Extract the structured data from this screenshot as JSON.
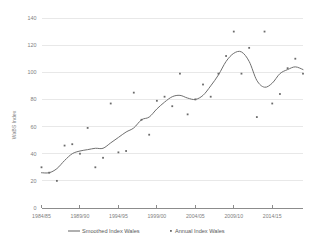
{
  "chart_data": {
    "type": "scatter",
    "title": "",
    "xlabel": "",
    "ylabel": "WaBS Index",
    "ylim": [
      0,
      140
    ],
    "y_ticks": [
      0,
      20,
      40,
      60,
      80,
      100,
      120,
      140
    ],
    "grid": true,
    "legend_position": "bottom",
    "x_tick_labels": [
      "1984/85",
      "1989/90",
      "1994/95",
      "1999/00",
      "2004/05",
      "2009/10",
      "2014/15"
    ],
    "x_tick_values": [
      1984,
      1989,
      1994,
      1999,
      2004,
      2009,
      2014
    ],
    "x_range": [
      1984,
      2018
    ],
    "series": [
      {
        "name": "Smoothed Index Wales",
        "type": "line",
        "marker": "none",
        "color": "#6f6f6f",
        "x": [
          1984,
          1985,
          1986,
          1987,
          1988,
          1989,
          1990,
          1991,
          1992,
          1993,
          1994,
          1995,
          1996,
          1997,
          1998,
          1999,
          2000,
          2001,
          2002,
          2003,
          2004,
          2005,
          2006,
          2007,
          2008,
          2009,
          2010,
          2011,
          2012,
          2013,
          2014,
          2015,
          2016,
          2017,
          2018
        ],
        "values": [
          26,
          26,
          29,
          35,
          40,
          42,
          43,
          44,
          44,
          48,
          52,
          56,
          59,
          65,
          67,
          73,
          78,
          82,
          83,
          81,
          80,
          83,
          90,
          98,
          108,
          114,
          115,
          108,
          94,
          89,
          92,
          99,
          102,
          104,
          102
        ]
      },
      {
        "name": "Annual Index Wales",
        "type": "scatter",
        "marker": "dot",
        "color": "#6b6b6b",
        "x": [
          1984,
          1985,
          1986,
          1987,
          1988,
          1989,
          1990,
          1991,
          1992,
          1993,
          1994,
          1995,
          1996,
          1997,
          1998,
          1999,
          2000,
          2001,
          2002,
          2003,
          2004,
          2005,
          2006,
          2007,
          2008,
          2009,
          2010,
          2011,
          2012,
          2013,
          2014,
          2015,
          2016,
          2017,
          2018
        ],
        "values": [
          30,
          26,
          20,
          46,
          47,
          40,
          59,
          30,
          37,
          77,
          41,
          42,
          85,
          65,
          54,
          79,
          82,
          75,
          99,
          69,
          80,
          91,
          82,
          99,
          112,
          130,
          99,
          118,
          67,
          130,
          77,
          84,
          103,
          110,
          99
        ]
      }
    ]
  },
  "legend": {
    "items": [
      {
        "label": "Smoothed Index Wales",
        "marker": "line"
      },
      {
        "label": "Annual Index Wales",
        "marker": "dot"
      }
    ]
  }
}
